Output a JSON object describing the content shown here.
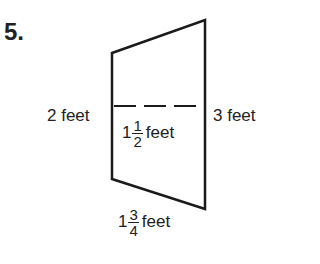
{
  "problem_number": "5.",
  "figure": {
    "shape": "trapezoid",
    "left_side": {
      "label": "2 feet"
    },
    "right_side": {
      "label": "3 feet"
    },
    "midline": {
      "whole": "1",
      "numerator": "1",
      "denominator": "2",
      "unit": "feet"
    },
    "bottom": {
      "whole": "1",
      "numerator": "3",
      "denominator": "4",
      "unit": "feet"
    }
  }
}
